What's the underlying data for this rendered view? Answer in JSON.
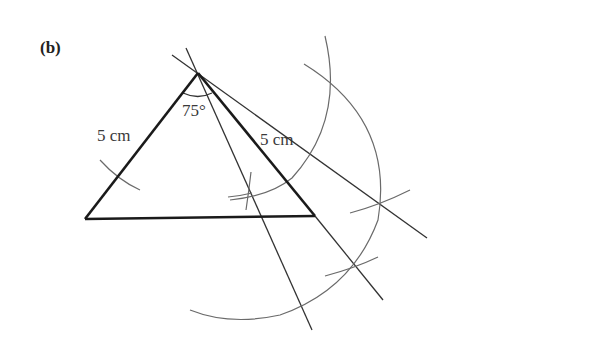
{
  "part_label": "(b)",
  "labels": {
    "left_side": "5 cm",
    "right_side": "5 cm",
    "apex_angle": "75°"
  },
  "colors": {
    "triangle": "#1a1a1a",
    "construction_line": "#333333",
    "arc": "#6a6a6a",
    "background": "#ffffff"
  },
  "geometry": {
    "apex": [
      198,
      73
    ],
    "bottom_left": [
      85,
      219
    ],
    "bottom_right": [
      315,
      216
    ]
  }
}
